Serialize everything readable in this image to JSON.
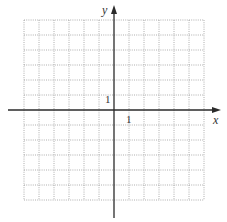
{
  "figure": {
    "type": "coordinate-grid",
    "x_axis_label": "x",
    "y_axis_label": "y",
    "x_tick_label": "1",
    "y_tick_label": "1",
    "grid": {
      "columns": 12,
      "rows": 12,
      "x_range": [
        -6,
        6
      ],
      "y_range": [
        -6,
        6
      ],
      "line_style": "dotted"
    },
    "colors": {
      "axis": "#2a2a2a",
      "grid": "#9a9a9a",
      "background": "#ffffff"
    }
  }
}
